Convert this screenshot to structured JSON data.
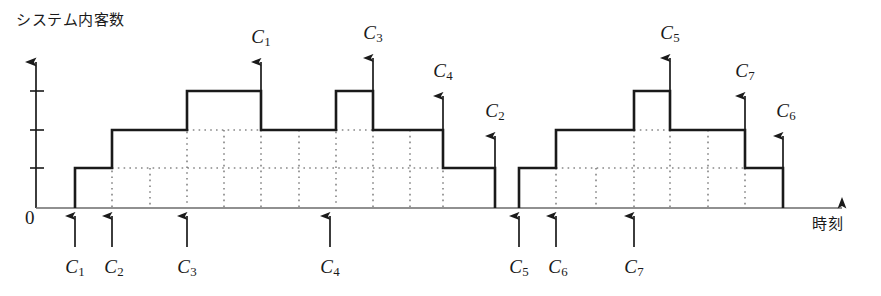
{
  "axes": {
    "ylabel": "システム内客数",
    "xlabel": "時刻",
    "origin": "0",
    "y_ticks": [
      1,
      2,
      3
    ],
    "y_range": [
      0,
      3.6
    ],
    "x_range": [
      0,
      881
    ],
    "grid": "dotted"
  },
  "chart_data": {
    "type": "line",
    "title": "",
    "subtitle": "",
    "xlabel": "時刻",
    "ylabel": "システム内客数",
    "ylim": [
      0,
      3.6
    ],
    "xlim": [
      0,
      100
    ],
    "grid": true,
    "legend_position": "none",
    "interpolation": "step-post",
    "series": [
      {
        "name": "システム内客数",
        "x": [
          9.0,
          9.0,
          14.0,
          14.0,
          23.5,
          23.5,
          32.0,
          32.0,
          45.5,
          45.5,
          52.0,
          52.0,
          57.5,
          57.5,
          62.5,
          62.5,
          66.5,
          66.5,
          70.5,
          70.5,
          76.0,
          76.0,
          86.5,
          86.5,
          92.5,
          92.5,
          97.5,
          97.5
        ],
        "y": [
          0,
          1,
          1,
          2,
          2,
          3,
          3,
          2,
          2,
          3,
          3,
          2,
          2,
          1,
          1,
          0,
          0,
          1,
          1,
          2,
          2,
          3,
          3,
          2,
          2,
          1,
          1,
          0
        ],
        "values_note": "piecewise-constant number of customers in system"
      }
    ],
    "steps": [
      {
        "x": 9.0,
        "from": 0,
        "to": 1,
        "event": "arrival",
        "customer": "C1"
      },
      {
        "x": 14.0,
        "from": 1,
        "to": 2,
        "event": "arrival",
        "customer": "C2"
      },
      {
        "x": 23.5,
        "from": 2,
        "to": 3,
        "event": "arrival",
        "customer": "C3"
      },
      {
        "x": 32.0,
        "from": 3,
        "to": 2,
        "event": "departure",
        "customer": "C1"
      },
      {
        "x": 45.5,
        "from": 2,
        "to": 3,
        "event": "arrival",
        "customer": "C4"
      },
      {
        "x": 52.0,
        "from": 3,
        "to": 2,
        "event": "departure",
        "customer": "C3"
      },
      {
        "x": 57.5,
        "from": 2,
        "to": 1,
        "event": "departure",
        "customer": "C4"
      },
      {
        "x": 62.5,
        "from": 1,
        "to": 0,
        "event": "departure",
        "customer": "C2"
      },
      {
        "x": 66.5,
        "from": 0,
        "to": 1,
        "event": "arrival",
        "customer": "C5"
      },
      {
        "x": 70.5,
        "from": 1,
        "to": 2,
        "event": "arrival",
        "customer": "C6"
      },
      {
        "x": 76.0,
        "from": 2,
        "to": 3,
        "event": "arrival",
        "customer": "C7"
      },
      {
        "x": 86.5,
        "from": 3,
        "to": 2,
        "event": "departure",
        "customer": "C5"
      },
      {
        "x": 92.5,
        "from": 2,
        "to": 1,
        "event": "departure",
        "customer": "C7"
      },
      {
        "x": 97.5,
        "from": 1,
        "to": 0,
        "event": "departure",
        "customer": "C6"
      }
    ]
  },
  "arrivals": [
    {
      "id": "C1",
      "sub": "1",
      "x_px": 75,
      "label_x_px": 75
    },
    {
      "id": "C2",
      "sub": "2",
      "x_px": 112,
      "label_x_px": 112
    },
    {
      "id": "C3",
      "sub": "3",
      "x_px": 187,
      "label_x_px": 187
    },
    {
      "id": "C4",
      "sub": "4",
      "x_px": 330,
      "label_x_px": 330
    },
    {
      "id": "C5",
      "sub": "5",
      "x_px": 519,
      "label_x_px": 519
    },
    {
      "id": "C6",
      "sub": "6",
      "x_px": 556,
      "label_x_px": 558
    },
    {
      "id": "C7",
      "sub": "7",
      "x_px": 634,
      "label_x_px": 634
    }
  ],
  "departures": [
    {
      "id": "C1",
      "sub": "1",
      "x_px": 261,
      "label_x_px": 261,
      "label_y_px": 26,
      "arrow_top_px": 62,
      "arrow_bottom_px": 91
    },
    {
      "id": "C3",
      "sub": "3",
      "x_px": 373,
      "label_x_px": 373,
      "label_y_px": 22,
      "arrow_top_px": 58,
      "arrow_bottom_px": 91
    },
    {
      "id": "C4",
      "sub": "4",
      "x_px": 443,
      "label_x_px": 443,
      "label_y_px": 60,
      "arrow_top_px": 96,
      "arrow_bottom_px": 130
    },
    {
      "id": "C2",
      "sub": "2",
      "x_px": 495,
      "label_x_px": 495,
      "label_y_px": 100,
      "arrow_top_px": 136,
      "arrow_bottom_px": 168
    },
    {
      "id": "C5",
      "sub": "5",
      "x_px": 670,
      "label_x_px": 670,
      "label_y_px": 22,
      "arrow_top_px": 58,
      "arrow_bottom_px": 91
    },
    {
      "id": "C7",
      "sub": "7",
      "x_px": 745,
      "label_x_px": 745,
      "label_y_px": 60,
      "arrow_top_px": 96,
      "arrow_bottom_px": 130
    },
    {
      "id": "C6",
      "sub": "6",
      "x_px": 783,
      "label_x_px": 786,
      "label_y_px": 100,
      "arrow_top_px": 136,
      "arrow_bottom_px": 168
    }
  ],
  "colors": {
    "curve": "#1a1a1a",
    "axis": "#555555",
    "grid": "#4d4d4d",
    "text": "#1a1a1a",
    "background": "#ffffff"
  }
}
